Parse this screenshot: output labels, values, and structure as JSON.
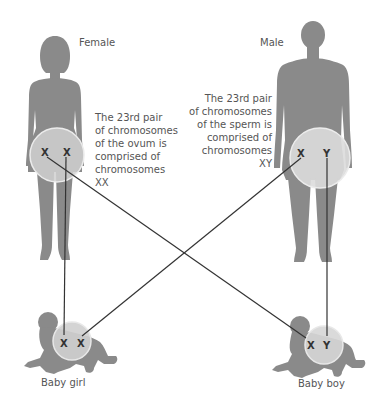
{
  "diagram": {
    "female": {
      "label": "Female",
      "description_lines": [
        "The 23rd pair",
        "of chromosomes",
        "of the ovum is",
        "comprised of",
        "chromosomes",
        "XX"
      ],
      "chromosomes": [
        "X",
        "X"
      ]
    },
    "male": {
      "label": "Male",
      "description_lines": [
        "The 23rd pair",
        "of chromosomes",
        "of the sperm is",
        "comprised of",
        "chromosomes",
        "XY"
      ],
      "chromosomes": [
        "X",
        "Y"
      ]
    },
    "baby_girl": {
      "label": "Baby girl",
      "chromosomes": [
        "X",
        "X"
      ]
    },
    "baby_boy": {
      "label": "Baby boy",
      "chromosomes": [
        "X",
        "Y"
      ]
    },
    "colors": {
      "silhouette": "#8a8a8a",
      "circle_fill": "#d4d4d4",
      "circle_stroke": "#e8e8e8",
      "line": "#333333",
      "text": "#555555"
    }
  }
}
